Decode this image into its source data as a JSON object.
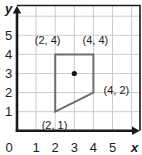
{
  "figure": {
    "background": "#ffffff"
  },
  "chart_data": {
    "type": "scatter",
    "xlabel": "x",
    "ylabel": "y",
    "xlim": [
      0,
      6.4
    ],
    "ylim": [
      0,
      6.4
    ],
    "grid": true,
    "grid_positions": [
      1,
      2,
      3,
      4,
      5,
      6
    ],
    "x_tick_labels": [
      "0",
      "1",
      "2",
      "3",
      "4",
      "5"
    ],
    "y_tick_labels": [
      "1",
      "2",
      "3",
      "4",
      "5"
    ],
    "series": [
      {
        "name": "quadrilateral",
        "shape": "polygon",
        "closed": true,
        "vertices": [
          [
            2,
            4
          ],
          [
            4,
            4
          ],
          [
            4,
            2
          ],
          [
            2,
            1
          ]
        ]
      },
      {
        "name": "marked-point",
        "shape": "point",
        "x": 3,
        "y": 3
      }
    ],
    "vertex_labels": [
      {
        "text": "(2, 4)",
        "vertex": [
          2,
          4
        ],
        "placement": "above-left"
      },
      {
        "text": "(4, 4)",
        "vertex": [
          4,
          4
        ],
        "placement": "above-right"
      },
      {
        "text": "(4, 2)",
        "vertex": [
          4,
          2
        ],
        "placement": "right"
      },
      {
        "text": "(2, 1)",
        "vertex": [
          2,
          1
        ],
        "placement": "below"
      }
    ],
    "colors": {
      "axis": "#1a1a1a",
      "frame": "#1a1a1a",
      "grid": "#cccccc",
      "shape_stroke": "#6f6f6f",
      "point_fill": "#111111",
      "text": "#1c1c1c"
    }
  }
}
